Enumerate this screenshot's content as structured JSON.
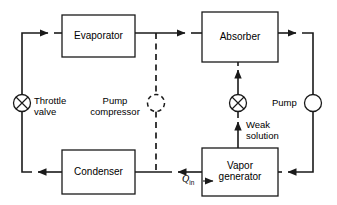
{
  "diagram": {
    "stroke_color": "#1a1a1a",
    "background_color": "#ffffff",
    "components": {
      "evaporator": {
        "label": "Evaporator",
        "x": 62,
        "y": 15,
        "w": 73,
        "h": 42
      },
      "absorber": {
        "label": "Absorber",
        "x": 202,
        "y": 12,
        "w": 76,
        "h": 50
      },
      "condenser": {
        "label": "Condenser",
        "x": 62,
        "y": 150,
        "w": 73,
        "h": 44
      },
      "vapor_generator": {
        "label": "Vapor\ngenerator",
        "x": 202,
        "y": 148,
        "w": 76,
        "h": 48
      }
    },
    "devices": {
      "throttle_valve": {
        "label": "Throttle\nvalve",
        "symbol": "crossed-circle",
        "cx": 22,
        "cy": 103,
        "r": 8.5
      },
      "pump_compressor": {
        "label": "Pump\ncompressor",
        "symbol": "dashed-circle",
        "cx": 156,
        "cy": 103,
        "r": 8.5
      },
      "weak_solution_valve": {
        "label": "Weak\nsolution",
        "symbol": "crossed-circle",
        "cx": 238,
        "cy": 103,
        "r": 8.5
      },
      "pump": {
        "label": "Pump",
        "symbol": "circle",
        "cx": 313,
        "cy": 103,
        "r": 8.5
      }
    },
    "annotations": {
      "heat_input": {
        "symbol": "Q",
        "subscript": "in",
        "x": 185,
        "y": 176
      }
    }
  }
}
